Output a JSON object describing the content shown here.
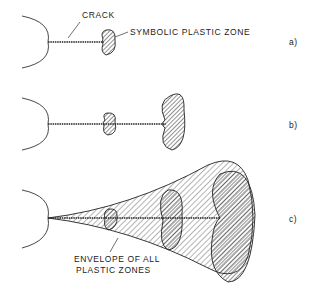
{
  "figure": {
    "panels": [
      {
        "id": "a",
        "tag": "a)",
        "labels": {
          "crack": "CRACK",
          "zone": "SYMBOLIC PLASTIC ZONE"
        }
      },
      {
        "id": "b",
        "tag": "b)"
      },
      {
        "id": "c",
        "tag": "c)",
        "labels": {
          "envelope_line1": "ENVELOPE OF ALL",
          "envelope_line2": "PLASTIC ZONES"
        }
      }
    ],
    "colors": {
      "ink": "#222222",
      "background": "#ffffff"
    }
  }
}
